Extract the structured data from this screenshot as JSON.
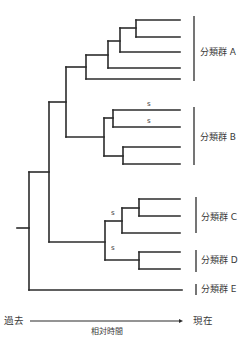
{
  "diagram": {
    "type": "phylogenetic-tree",
    "colors": {
      "line": "#2b2b2b",
      "text": "#3a3a3a",
      "background": "#ffffff"
    },
    "branches": [
      {
        "id": "root-stub",
        "x1": 17,
        "y1": 228,
        "x2": 29,
        "y2": 228
      },
      {
        "id": "root-vertical",
        "x1": 29,
        "y1": 172,
        "x2": 29,
        "y2": 290
      },
      {
        "id": "leaf-E",
        "x1": 29,
        "y1": 290,
        "x2": 182,
        "y2": 290
      },
      {
        "id": "abcd-stem",
        "x1": 29,
        "y1": 172,
        "x2": 49,
        "y2": 172
      },
      {
        "id": "abcd-vertical",
        "x1": 49,
        "y1": 102,
        "x2": 49,
        "y2": 242
      },
      {
        "id": "ab-stem",
        "x1": 49,
        "y1": 102,
        "x2": 66,
        "y2": 102
      },
      {
        "id": "ab-vertical",
        "x1": 66,
        "y1": 67,
        "x2": 66,
        "y2": 137
      },
      {
        "id": "a-stem",
        "x1": 66,
        "y1": 67,
        "x2": 86,
        "y2": 67
      },
      {
        "id": "a-vertical",
        "x1": 86,
        "y1": 55,
        "x2": 86,
        "y2": 79
      },
      {
        "id": "leaf-A5",
        "x1": 86,
        "y1": 79,
        "x2": 180,
        "y2": 79
      },
      {
        "id": "a3-stem",
        "x1": 86,
        "y1": 55,
        "x2": 108,
        "y2": 55
      },
      {
        "id": "a3-vertical",
        "x1": 108,
        "y1": 41,
        "x2": 108,
        "y2": 68
      },
      {
        "id": "leaf-A4",
        "x1": 108,
        "y1": 68,
        "x2": 180,
        "y2": 68
      },
      {
        "id": "a2-stem",
        "x1": 108,
        "y1": 41,
        "x2": 120,
        "y2": 41
      },
      {
        "id": "a2-vertical",
        "x1": 120,
        "y1": 28,
        "x2": 120,
        "y2": 52
      },
      {
        "id": "leaf-A3",
        "x1": 120,
        "y1": 52,
        "x2": 180,
        "y2": 52
      },
      {
        "id": "a1-stem",
        "x1": 120,
        "y1": 28,
        "x2": 136,
        "y2": 28
      },
      {
        "id": "a1-vertical",
        "x1": 136,
        "y1": 20,
        "x2": 136,
        "y2": 37
      },
      {
        "id": "leaf-A1",
        "x1": 136,
        "y1": 20,
        "x2": 180,
        "y2": 20
      },
      {
        "id": "leaf-A2",
        "x1": 136,
        "y1": 37,
        "x2": 180,
        "y2": 37
      },
      {
        "id": "b-stem",
        "x1": 66,
        "y1": 137,
        "x2": 104,
        "y2": 137
      },
      {
        "id": "b-vertical",
        "x1": 104,
        "y1": 118,
        "x2": 104,
        "y2": 156
      },
      {
        "id": "b1-stem",
        "x1": 104,
        "y1": 118,
        "x2": 113,
        "y2": 118
      },
      {
        "id": "b1-vertical",
        "x1": 113,
        "y1": 110,
        "x2": 113,
        "y2": 127
      },
      {
        "id": "leaf-B1",
        "x1": 113,
        "y1": 110,
        "x2": 180,
        "y2": 110
      },
      {
        "id": "leaf-B2",
        "x1": 113,
        "y1": 127,
        "x2": 180,
        "y2": 127
      },
      {
        "id": "b2-stem",
        "x1": 104,
        "y1": 156,
        "x2": 123,
        "y2": 156
      },
      {
        "id": "b2-vertical",
        "x1": 123,
        "y1": 147,
        "x2": 123,
        "y2": 164
      },
      {
        "id": "leaf-B3",
        "x1": 123,
        "y1": 147,
        "x2": 180,
        "y2": 147
      },
      {
        "id": "leaf-B4",
        "x1": 123,
        "y1": 164,
        "x2": 180,
        "y2": 164
      },
      {
        "id": "cd-stem",
        "x1": 49,
        "y1": 242,
        "x2": 105,
        "y2": 242
      },
      {
        "id": "cd-vertical",
        "x1": 105,
        "y1": 221,
        "x2": 105,
        "y2": 260
      },
      {
        "id": "c-stem",
        "x1": 105,
        "y1": 221,
        "x2": 122,
        "y2": 221
      },
      {
        "id": "c-vertical",
        "x1": 122,
        "y1": 208,
        "x2": 122,
        "y2": 233
      },
      {
        "id": "leaf-C3",
        "x1": 122,
        "y1": 233,
        "x2": 180,
        "y2": 233
      },
      {
        "id": "c1-stem",
        "x1": 122,
        "y1": 208,
        "x2": 139,
        "y2": 208
      },
      {
        "id": "c1-vertical",
        "x1": 139,
        "y1": 199,
        "x2": 139,
        "y2": 216
      },
      {
        "id": "leaf-C1",
        "x1": 139,
        "y1": 199,
        "x2": 180,
        "y2": 199
      },
      {
        "id": "leaf-C2",
        "x1": 139,
        "y1": 216,
        "x2": 180,
        "y2": 216
      },
      {
        "id": "d-stem",
        "x1": 105,
        "y1": 260,
        "x2": 139,
        "y2": 260
      },
      {
        "id": "d-vertical",
        "x1": 139,
        "y1": 252,
        "x2": 139,
        "y2": 269
      },
      {
        "id": "leaf-D1",
        "x1": 139,
        "y1": 252,
        "x2": 180,
        "y2": 252
      },
      {
        "id": "leaf-D2",
        "x1": 139,
        "y1": 269,
        "x2": 180,
        "y2": 269
      }
    ],
    "support_labels": [
      {
        "text": "s",
        "x": 147,
        "y": 106
      },
      {
        "text": "s",
        "x": 147,
        "y": 123
      },
      {
        "text": "s",
        "x": 111,
        "y": 215
      },
      {
        "text": "s",
        "x": 111,
        "y": 250
      }
    ],
    "groups": [
      {
        "label": "分類群 A",
        "bar_x": 194,
        "y1": 16,
        "y2": 81,
        "label_x": 200,
        "label_y": 47
      },
      {
        "label": "分類群 B",
        "bar_x": 194,
        "y1": 107,
        "y2": 165,
        "label_x": 200,
        "label_y": 132
      },
      {
        "label": "分類群 C",
        "bar_x": 196,
        "y1": 197,
        "y2": 233,
        "label_x": 201,
        "label_y": 212
      },
      {
        "label": "分類群 D",
        "bar_x": 196,
        "y1": 250,
        "y2": 272,
        "label_x": 201,
        "label_y": 255
      },
      {
        "label": "分類群 E",
        "bar_x": 196,
        "y1": 284,
        "y2": 295,
        "label_x": 201,
        "label_y": 284
      }
    ],
    "time_axis": {
      "left_label": "過去",
      "right_label": "現在",
      "caption": "相対時間",
      "x1": 30,
      "x2": 183,
      "y": 321
    }
  }
}
